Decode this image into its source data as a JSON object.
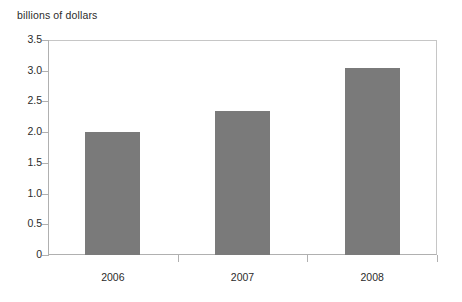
{
  "chart_data": {
    "type": "bar",
    "title": "",
    "subtitle": "",
    "ylabel": "billions of dollars",
    "xlabel": "",
    "categories": [
      "2006",
      "2007",
      "2008"
    ],
    "values": [
      2.0,
      2.35,
      3.05
    ],
    "series": [
      {
        "name": "billions of dollars",
        "values": [
          2.0,
          2.35,
          3.05
        ],
        "color": "#7a7a7a"
      }
    ],
    "ylim": [
      0,
      3.5
    ],
    "ytick_labels": [
      "3.5",
      "3.0",
      "2.5",
      "2.0",
      "1.5",
      "1.0",
      "0.5",
      "0"
    ],
    "ytick_values": [
      3.5,
      3.0,
      2.5,
      2.0,
      1.5,
      1.0,
      0.5,
      0
    ],
    "grid": false,
    "legend": false,
    "legend_position": "none",
    "bar_color": "#7a7a7a",
    "axis_color": "#b0b0b0",
    "frame_color": "#c6c6c6",
    "background_color": "#ffffff",
    "text_color": "#2b2b2b"
  }
}
